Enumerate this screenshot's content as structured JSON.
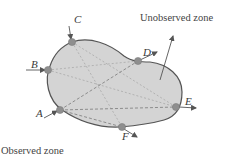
{
  "diagram": {
    "unobserved_label": "Unobserved zone",
    "observed_label": "Observed zone",
    "points": [
      {
        "id": "A",
        "label": "A"
      },
      {
        "id": "B",
        "label": "B"
      },
      {
        "id": "C",
        "label": "C"
      },
      {
        "id": "D",
        "label": "D"
      },
      {
        "id": "E",
        "label": "E"
      },
      {
        "id": "F",
        "label": "F"
      }
    ],
    "colors": {
      "blob_fill": "#d4d4d4",
      "blob_stroke": "#555555",
      "point_fill": "#8e8e8e",
      "arrow": "#555555",
      "dashed": "#8a8a8a"
    }
  }
}
